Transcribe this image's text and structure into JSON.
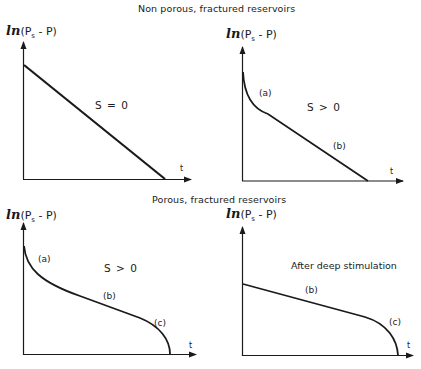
{
  "sections": {
    "top_title": "Non porous, fractured reservoirs",
    "bottom_title": "Porous, fractured reservoirs"
  },
  "axis": {
    "ylabel_fn": "ln",
    "ylabel_open": "(P",
    "ylabel_sub": "s",
    "ylabel_rest": " - P)",
    "xlabel": "t"
  },
  "panels": [
    {
      "id": "top-left",
      "condition": "S = 0",
      "segments": []
    },
    {
      "id": "top-right",
      "condition": "S > 0",
      "segments": [
        "(a)",
        "(b)"
      ]
    },
    {
      "id": "bottom-left",
      "condition": "S > 0",
      "segments": [
        "(a)",
        "(b)",
        "(c)"
      ]
    },
    {
      "id": "bottom-right",
      "condition": "After deep stimulation",
      "segments": [
        "(b)",
        "(c)"
      ]
    }
  ],
  "colors": {
    "ink": "#1a1a1a",
    "background": "#ffffff"
  }
}
